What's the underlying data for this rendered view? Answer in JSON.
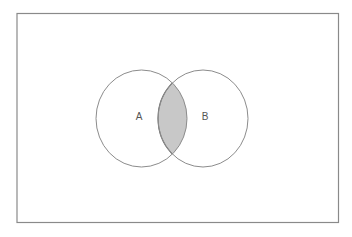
{
  "diagram": {
    "type": "venn",
    "frame": {
      "x": 17,
      "y": 13.5,
      "width": 321.5,
      "height": 209
    },
    "sets": [
      {
        "label": "A",
        "cx": 141.5,
        "cy": 118.5,
        "rx": 45.5,
        "ry": 48.5,
        "label_x": 139,
        "label_y": 116
      },
      {
        "label": "B",
        "cx": 203,
        "cy": 118.5,
        "rx": 45,
        "ry": 48.5,
        "label_x": 205,
        "label_y": 116
      }
    ],
    "highlighted_region": "A ∩ B",
    "colors": {
      "background": "#ffffff",
      "frame_stroke": "#8a8a8a",
      "circle_stroke": "#8c8c8c",
      "intersection_fill": "#c8c8c8",
      "intersection_stroke": "#6e6e6e",
      "label": "#555555"
    }
  }
}
